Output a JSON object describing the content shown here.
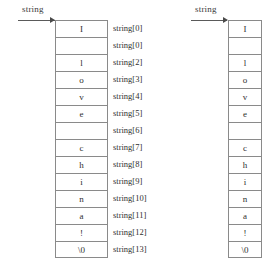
{
  "figure": {
    "type": "memory-array-diagram",
    "colors": {
      "background": "#ffffff",
      "cell_border": "#8a8a8a",
      "pointer_line": "#5a5a5a",
      "text": "#2f2f2f"
    }
  },
  "left_diagram": {
    "pointer_label": "string",
    "cells": [
      {
        "char": "I"
      },
      {
        "char": ""
      },
      {
        "char": "l"
      },
      {
        "char": "o"
      },
      {
        "char": "v"
      },
      {
        "char": "e"
      },
      {
        "char": ""
      },
      {
        "char": "c"
      },
      {
        "char": "h"
      },
      {
        "char": "i"
      },
      {
        "char": "n"
      },
      {
        "char": "a"
      },
      {
        "char": "!"
      },
      {
        "char": "\\0"
      }
    ],
    "index_labels": [
      "string[0]",
      "string[0]",
      "string[2]",
      "string[3]",
      "string[4]",
      "string[5]",
      "string[6]",
      "string[7]",
      "string[8]",
      "string[9]",
      "string[10]",
      "string[11]",
      "string[12]",
      "string[13]"
    ]
  },
  "right_diagram": {
    "pointer_label": "string",
    "cells": [
      {
        "char": "I"
      },
      {
        "char": ""
      },
      {
        "char": "l"
      },
      {
        "char": "o"
      },
      {
        "char": "v"
      },
      {
        "char": "e"
      },
      {
        "char": ""
      },
      {
        "char": "c"
      },
      {
        "char": "h"
      },
      {
        "char": "i"
      },
      {
        "char": "n"
      },
      {
        "char": "a"
      },
      {
        "char": "!"
      },
      {
        "char": "\\0"
      }
    ]
  }
}
